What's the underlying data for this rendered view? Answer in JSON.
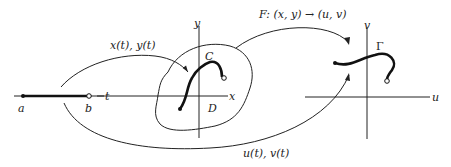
{
  "diagram": {
    "colors": {
      "ink": "#222222",
      "background": "#ffffff"
    },
    "interval": {
      "left_label": "a",
      "right_label": "b",
      "axis_label": "t"
    },
    "domain_plane": {
      "x_axis_label": "x",
      "y_axis_label": "y",
      "curve_label": "C",
      "region_label": "D"
    },
    "image_plane": {
      "u_axis_label": "u",
      "v_axis_label": "v",
      "curve_label": "Γ"
    },
    "arrows": {
      "param_xy": "x(t), y(t)",
      "mapping_F": "F: (x, y) → (u, v)",
      "param_uv": "u(t), v(t)"
    }
  }
}
